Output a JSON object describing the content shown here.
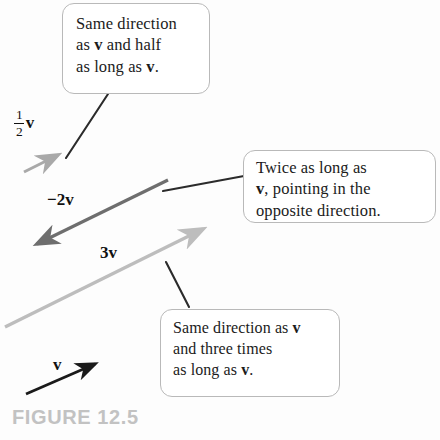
{
  "figure": {
    "caption": "FIGURE 12.5",
    "background_color": "#fdfdfd",
    "caption_color": "#c2c2c2"
  },
  "callouts": [
    {
      "id": "half-v",
      "lines": [
        "Same direction",
        "as v and half",
        "as long as v."
      ],
      "line1": "Same direction",
      "line2_pre": "as ",
      "line2_vec": "v",
      "line2_post": " and half",
      "line3_pre": "as long as ",
      "line3_vec": "v",
      "line3_post": "."
    },
    {
      "id": "minus-2v",
      "lines": [
        "Twice as long as",
        "v, pointing in the",
        "opposite direction."
      ],
      "line1": "Twice as long as",
      "line2_pre": "",
      "line2_vec": "v",
      "line2_post": ", pointing in the",
      "line3": "opposite direction."
    },
    {
      "id": "3v",
      "lines": [
        "Same direction as v",
        "and three times",
        "as long as v."
      ],
      "line1_pre": "Same direction as ",
      "line1_vec": "v",
      "line2": "and three times",
      "line3_pre": "as long as ",
      "line3_vec": "v",
      "line3_post": "."
    }
  ],
  "vector_labels": {
    "half_v_numerator": "1",
    "half_v_denominator": "2",
    "half_v_symbol": "v",
    "minus_2v": "−2v",
    "three_v": "3v",
    "v": "v"
  },
  "vectors": [
    {
      "name": "half-v",
      "label": "½v",
      "color": "#a9a9a9",
      "x1": 24,
      "y1": 172,
      "x2": 62,
      "y2": 153,
      "scalar": 0.5,
      "description": "Same direction as v and half as long as v."
    },
    {
      "name": "minus-2v",
      "label": "−2v",
      "color": "#6e6e6e",
      "x1": 168,
      "y1": 180,
      "x2": 32,
      "y2": 247,
      "scalar": -2,
      "description": "Twice as long as v, pointing in the opposite direction."
    },
    {
      "name": "three-v",
      "label": "3v",
      "color": "#bdbdbd",
      "x1": 5,
      "y1": 327,
      "x2": 207,
      "y2": 227,
      "scalar": 3,
      "description": "Same direction as v and three times as long as v."
    },
    {
      "name": "v",
      "label": "v",
      "color": "#1a1a1a",
      "x1": 26,
      "y1": 394,
      "x2": 99,
      "y2": 362,
      "scalar": 1,
      "description": "The base vector v."
    }
  ],
  "leader_lines": [
    {
      "name": "leader-half-v",
      "x1": 108,
      "y1": 94,
      "x2": 66,
      "y2": 158
    },
    {
      "name": "leader-minus-2v",
      "x1": 244,
      "y1": 176,
      "x2": 163,
      "y2": 191
    },
    {
      "name": "leader-3v",
      "x1": 189,
      "y1": 307,
      "x2": 166,
      "y2": 262
    }
  ]
}
